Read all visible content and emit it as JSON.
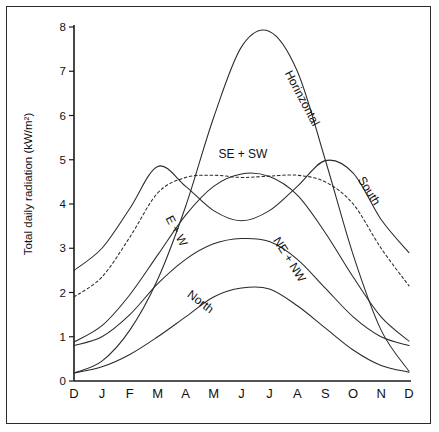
{
  "chart_data": {
    "type": "line",
    "title": "",
    "xlabel": "",
    "ylabel": "Total daily radiation (kW/m²)",
    "xlim": [
      0,
      12
    ],
    "ylim": [
      0,
      8
    ],
    "grid": false,
    "legend_position": "inline-curve-labels",
    "categories": [
      "D",
      "J",
      "F",
      "M",
      "A",
      "M",
      "J",
      "J",
      "A",
      "S",
      "O",
      "N",
      "D"
    ],
    "xtick_labels": [
      "D",
      "J",
      "F",
      "M",
      "A",
      "M",
      "J",
      "J",
      "A",
      "S",
      "O",
      "N",
      "D"
    ],
    "ytick_labels": [
      "0",
      "1",
      "2",
      "3",
      "4",
      "5",
      "6",
      "7",
      "8"
    ],
    "ytick_values": [
      0,
      1,
      2,
      3,
      4,
      5,
      6,
      7,
      8
    ],
    "series": [
      {
        "name": "Horinzontal",
        "style": "solid",
        "label_x_index": 8.05,
        "label_y_value": 6.35,
        "label_rotation": 62,
        "values": [
          0.18,
          0.45,
          1.15,
          2.3,
          3.95,
          5.95,
          7.55,
          7.9,
          7.0,
          5.0,
          2.85,
          1.15,
          0.22
        ]
      },
      {
        "name": "South",
        "style": "solid",
        "label_x_index": 10.45,
        "label_y_value": 4.25,
        "label_rotation": 58,
        "values": [
          2.5,
          3.0,
          3.9,
          4.85,
          4.4,
          3.85,
          3.62,
          3.85,
          4.4,
          4.98,
          4.7,
          3.65,
          2.9
        ]
      },
      {
        "name": "SE + SW",
        "style": "dashed",
        "label_x_index": 6.05,
        "label_y_value": 5.05,
        "label_rotation": 0,
        "values": [
          1.9,
          2.35,
          3.25,
          4.25,
          4.6,
          4.65,
          4.6,
          4.63,
          4.65,
          4.5,
          4.0,
          3.0,
          2.15
        ]
      },
      {
        "name": "E + W",
        "style": "solid",
        "label_x_index": 3.55,
        "label_y_value": 3.35,
        "label_rotation": 62,
        "values": [
          0.88,
          1.25,
          1.95,
          2.85,
          3.75,
          4.4,
          4.68,
          4.62,
          4.2,
          3.35,
          2.35,
          1.45,
          0.9
        ]
      },
      {
        "name": "NE + NW",
        "style": "solid",
        "label_x_index": 7.6,
        "label_y_value": 2.7,
        "label_rotation": 58,
        "values": [
          0.8,
          1.0,
          1.5,
          2.2,
          2.75,
          3.1,
          3.22,
          3.15,
          2.75,
          2.1,
          1.45,
          1.0,
          0.8
        ]
      },
      {
        "name": "North",
        "style": "solid",
        "label_x_index": 4.45,
        "label_y_value": 1.72,
        "label_rotation": 37,
        "values": [
          0.18,
          0.32,
          0.6,
          1.0,
          1.45,
          1.9,
          2.1,
          2.08,
          1.7,
          1.2,
          0.7,
          0.35,
          0.2
        ]
      }
    ]
  }
}
